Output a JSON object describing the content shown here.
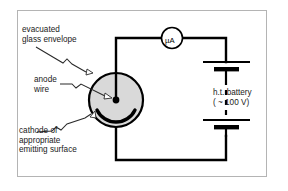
{
  "figure": {
    "background_color": "#ffffff",
    "frame_border_color": "#b4b4b4"
  },
  "labels": {
    "envelope": "evacuated\nglass envelope",
    "anode": "anode\nwire",
    "cathode": "cathode of\nappropriate\nemitting surface",
    "battery": "h.t. battery\n( ~ 100 V)"
  },
  "components": {
    "meter": {
      "name": "microammeter",
      "label": "µA",
      "shape": "circle",
      "center_x": 172,
      "center_y": 41,
      "radius": 10
    },
    "tube": {
      "name": "evacuated-glass-envelope",
      "shape": "circle",
      "center_x": 116,
      "center_y": 100,
      "radius": 27,
      "fill_color": "#d9d9d9",
      "stroke_color": "#000000"
    },
    "anode": {
      "name": "anode-wire",
      "terminal_dot_x": 116,
      "terminal_dot_y": 100,
      "terminal_dot_radius": 3.2
    },
    "cathode": {
      "name": "cathode-emitting-surface",
      "shape": "thick-arc",
      "description": "curved emitting surface at base of tube"
    },
    "battery": {
      "name": "ht-battery",
      "cells": 2,
      "voltage_text": "( ~ 100 V)",
      "type_text": "h.t. battery"
    }
  },
  "colors": {
    "wire": "#000000",
    "tube_fill": "#d9d9d9",
    "text": "#1a1a1a",
    "frame": "#b4b4b4"
  }
}
